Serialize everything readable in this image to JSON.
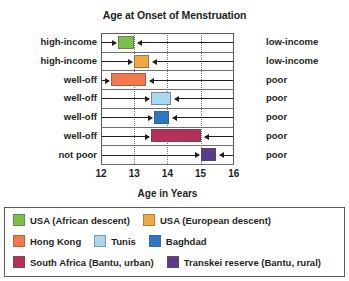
{
  "chart_data": {
    "type": "bar",
    "orientation": "horizontal-range",
    "title": "Age at Onset of Menstruation",
    "xlabel": "Age in Years",
    "ylabel": "",
    "xlim": [
      12,
      16
    ],
    "xticks": [
      12,
      13,
      14,
      15,
      16
    ],
    "xtick_labels": [
      "12",
      "13",
      "14",
      "15",
      "16"
    ],
    "grid": "vertical dotted at 13, 14, 15; horizontal solid row separators",
    "legend_position": "below-plot-boxed",
    "rows": [
      {
        "left_label": "high-income",
        "right_label": "low-income",
        "group": "USA (African descent)",
        "color": "#7cc04a",
        "start": 12.52,
        "end": 13.0
      },
      {
        "left_label": "high-income",
        "right_label": "low-income",
        "group": "USA (European descent)",
        "color": "#f2a93b",
        "start": 13.0,
        "end": 13.45
      },
      {
        "left_label": "well-off",
        "right_label": "poor",
        "group": "Hong Kong",
        "color": "#f37748",
        "start": 12.3,
        "end": 13.35
      },
      {
        "left_label": "well-off",
        "right_label": "poor",
        "group": "Tunis",
        "color": "#a8d8f0",
        "start": 13.5,
        "end": 14.1
      },
      {
        "left_label": "well-off",
        "right_label": "poor",
        "group": "Baghdad",
        "color": "#2878c8",
        "start": 13.6,
        "end": 14.05
      },
      {
        "left_label": "well-off",
        "right_label": "poor",
        "group": "South Africa (Bantu, urban)",
        "color": "#b52f57",
        "start": 13.5,
        "end": 15.0
      },
      {
        "left_label": "not poor",
        "right_label": "poor",
        "group": "Transkei reserve (Bantu, rural)",
        "color": "#5b3a8e",
        "start": 15.0,
        "end": 15.45
      }
    ],
    "legend": [
      {
        "label": "USA (African descent)",
        "color": "#7cc04a"
      },
      {
        "label": "USA (European descent)",
        "color": "#f2a93b"
      },
      {
        "label": "Hong Kong",
        "color": "#f37748"
      },
      {
        "label": "Tunis",
        "color": "#a8d8f0"
      },
      {
        "label": "Baghdad",
        "color": "#2878c8"
      },
      {
        "label": "South Africa (Bantu, urban)",
        "color": "#b52f57"
      },
      {
        "label": "Transkei reserve (Bantu, rural)",
        "color": "#5b3a8e"
      }
    ]
  }
}
